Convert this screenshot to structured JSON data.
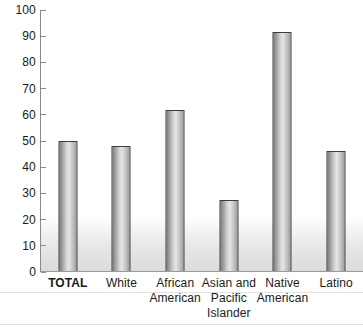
{
  "chart_data": {
    "type": "bar",
    "title": "",
    "xlabel": "",
    "ylabel": "",
    "ylim": [
      0,
      100
    ],
    "ytick_step": 10,
    "grid": false,
    "legend": null,
    "categories": [
      "TOTAL",
      "African American",
      "Asian and Pacific Islander",
      "Native American",
      "Latino",
      "White"
    ],
    "y_ticks": [
      "100",
      "90",
      "80",
      "70",
      "60",
      "50",
      "40",
      "30",
      "20",
      "10",
      "0"
    ],
    "bars": [
      {
        "label_lines": [
          "TOTAL"
        ],
        "value": 50,
        "emphasis": true
      },
      {
        "label_lines": [
          "White"
        ],
        "value": 48,
        "emphasis": false
      },
      {
        "label_lines": [
          "African",
          "American"
        ],
        "value": 62,
        "emphasis": false
      },
      {
        "label_lines": [
          "Asian and",
          "Pacific",
          "Islander"
        ],
        "value": 27.5,
        "emphasis": false
      },
      {
        "label_lines": [
          "Native",
          "American"
        ],
        "value": 91.5,
        "emphasis": false
      },
      {
        "label_lines": [
          "Latino"
        ],
        "value": 46,
        "emphasis": false
      }
    ],
    "values": [
      50,
      48,
      62,
      27.5,
      91.5,
      46
    ],
    "colors": {
      "bar_border": "#3d3d3d",
      "bar_fill_light": "#e4e4e4",
      "bar_fill_dark": "#7c7c7c",
      "axis": "#8a8a8a",
      "text": "#1a1a1a",
      "background": "#ffffff"
    }
  }
}
